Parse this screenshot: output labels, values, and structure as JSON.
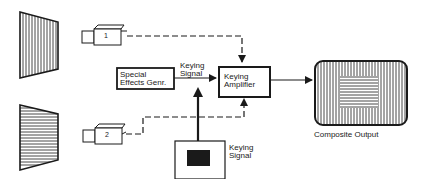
{
  "diagram": {
    "title": "",
    "colors": {
      "stroke": "#1a1a1a",
      "background": "#ffffff",
      "fill_dark": "#1a1a1a"
    },
    "nodes": [
      {
        "id": "scene1",
        "label": "",
        "shape": "trapezoid-vertical-stripes"
      },
      {
        "id": "scene2",
        "label": "",
        "shape": "trapezoid-horizontal-stripes"
      },
      {
        "id": "camera1",
        "label": "1",
        "shape": "camera-icon"
      },
      {
        "id": "camera2",
        "label": "2",
        "shape": "camera-icon"
      },
      {
        "id": "seg",
        "label": "Special Effects Genr.",
        "lines": [
          "Special",
          "Effects Genr."
        ],
        "shape": "box"
      },
      {
        "id": "amp",
        "label": "Keying Amplifier",
        "lines": [
          "Keying",
          "Amplifier"
        ],
        "shape": "box"
      },
      {
        "id": "keysource",
        "label": "Keying Signal",
        "lines": [
          "Keying",
          "Signal"
        ],
        "shape": "box-with-black-rect"
      },
      {
        "id": "output",
        "label": "Composite Output",
        "shape": "rounded-monitor"
      }
    ],
    "edges": [
      {
        "from": "camera1",
        "to": "amp",
        "style": "dashed",
        "arrow": true
      },
      {
        "from": "camera2",
        "to": "amp",
        "style": "dashed",
        "arrow": true
      },
      {
        "from": "seg",
        "to": "amp",
        "style": "solid",
        "label": "Keying Signal",
        "label_lines": [
          "Keying",
          "Signal"
        ],
        "arrow": true
      },
      {
        "from": "keysource",
        "to": "seg-amp-line",
        "style": "solid-thick",
        "arrow": true
      },
      {
        "from": "amp",
        "to": "output",
        "style": "solid",
        "arrow": true
      }
    ]
  },
  "labels": {
    "cam1": "1",
    "cam2": "2",
    "seg_l1": "Special",
    "seg_l2": "Effects Genr.",
    "amp_l1": "Keying",
    "amp_l2": "Amplifier",
    "edge_l1": "Keying",
    "edge_l2": "Signal",
    "key_l1": "Keying",
    "key_l2": "Signal",
    "output": "Composite Output"
  }
}
